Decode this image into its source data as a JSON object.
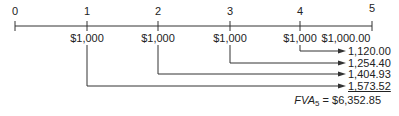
{
  "timeline": {
    "periods": [
      "0",
      "1",
      "2",
      "3",
      "4",
      "5"
    ],
    "payments": [
      "$1,000",
      "$1,000",
      "$1,000",
      "$1,000",
      "$1,000.00"
    ]
  },
  "future_values": [
    "1,120.00",
    "1,254.40",
    "1,404.93",
    "1,573.52"
  ],
  "total": {
    "label_main": "FVA",
    "label_sub": "5",
    "equals": " = ",
    "value": "$6,352.85"
  }
}
